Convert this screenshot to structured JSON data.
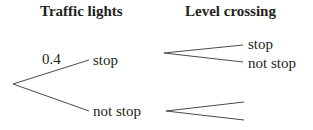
{
  "headers": {
    "stage1": "Traffic lights",
    "stage2": "Level crossing"
  },
  "stage1": {
    "branches": [
      {
        "label": "stop",
        "probability": "0.4"
      },
      {
        "label": "not stop",
        "probability": ""
      }
    ]
  },
  "stage2": {
    "after_stop": [
      {
        "label": "stop"
      },
      {
        "label": "not stop"
      }
    ],
    "after_not_stop": [
      {
        "label": ""
      },
      {
        "label": ""
      }
    ]
  },
  "colors": {
    "text": "#231f20",
    "line": "#4a4a4a"
  }
}
